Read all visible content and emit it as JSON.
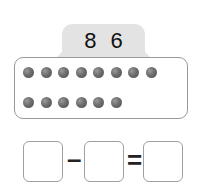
{
  "header_tab": {
    "numbers": [
      "8",
      "6"
    ]
  },
  "dots": {
    "row1_count": 8,
    "row2_count": 6,
    "color": "#6d6d6d"
  },
  "equation": {
    "operator1": "–",
    "operator2": "=",
    "boxes": [
      "",
      "",
      ""
    ]
  }
}
